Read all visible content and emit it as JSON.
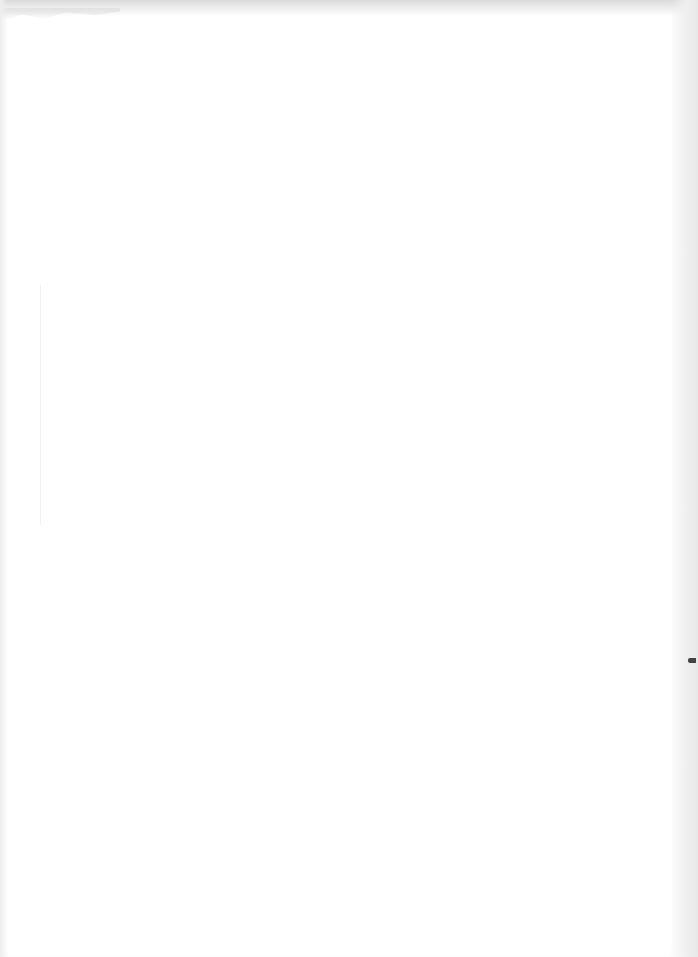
{
  "document": {
    "type": "blank scanned page",
    "text_content": [],
    "colors": {
      "page": "#ffffff",
      "scan_background": "#f7f7f7",
      "edge_shadow": "#e8e8e8",
      "speck": "#444444"
    }
  }
}
